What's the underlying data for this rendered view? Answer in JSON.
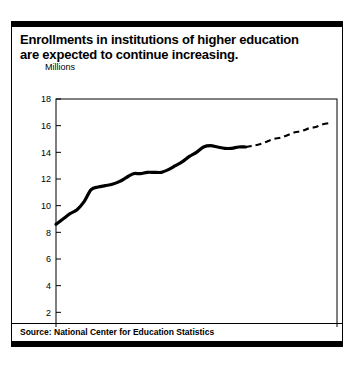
{
  "figure": {
    "title_lines": [
      "Enrollments in institutions of higher education",
      "are expected to continue increasing."
    ],
    "source": "Source: National Center for Education Statistics"
  },
  "chart_data": {
    "type": "line",
    "title": "Enrollments in institutions of higher education are expected to continue increasing.",
    "xlabel": "",
    "ylabel": "Millions",
    "units_label": "Millions",
    "xlim": [
      1970,
      2010
    ],
    "ylim": [
      0,
      18
    ],
    "xticks": [
      1970,
      1975,
      1980,
      1985,
      1990,
      1995,
      2000,
      2005,
      2010
    ],
    "yticks": [
      0,
      2,
      4,
      6,
      8,
      10,
      12,
      14,
      16,
      18
    ],
    "grid": false,
    "legend": null,
    "series": [
      {
        "name": "Actual enrollment",
        "style": "solid",
        "color": "#000000",
        "x": [
          1970,
          1971,
          1972,
          1973,
          1974,
          1975,
          1976,
          1977,
          1978,
          1979,
          1980,
          1981,
          1982,
          1983,
          1984,
          1985,
          1986,
          1987,
          1988,
          1989,
          1990,
          1991,
          1992,
          1993,
          1994,
          1995,
          1996,
          1997
        ],
        "values": [
          8.6,
          9.0,
          9.4,
          9.7,
          10.3,
          11.2,
          11.4,
          11.5,
          11.6,
          11.8,
          12.1,
          12.4,
          12.4,
          12.5,
          12.5,
          12.5,
          12.7,
          13.0,
          13.3,
          13.7,
          14.0,
          14.4,
          14.5,
          14.4,
          14.3,
          14.3,
          14.4,
          14.4
        ]
      },
      {
        "name": "Projected enrollment",
        "style": "dashed",
        "color": "#000000",
        "x": [
          1997,
          1998,
          1999,
          2000,
          2001,
          2002,
          2003,
          2004,
          2005,
          2006,
          2007,
          2008,
          2009
        ],
        "values": [
          14.4,
          14.5,
          14.6,
          14.8,
          15.0,
          15.1,
          15.3,
          15.5,
          15.6,
          15.8,
          15.9,
          16.1,
          16.2
        ]
      }
    ]
  }
}
